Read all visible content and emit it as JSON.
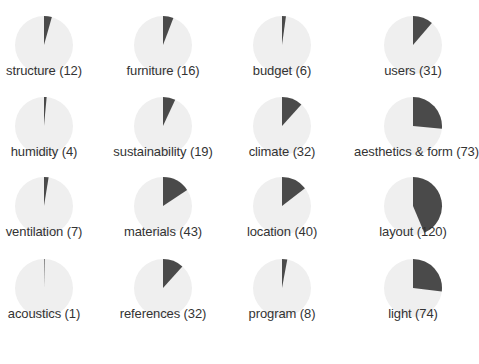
{
  "chart_data": {
    "type": "pie",
    "layout": "small-multiples 4x4",
    "total": 275,
    "colors": {
      "slice": "#4a4a4a",
      "rest": "#efefef"
    },
    "panels": [
      {
        "name": "structure",
        "value": 12,
        "label": "structure (12)"
      },
      {
        "name": "furniture",
        "value": 16,
        "label": "furniture (16)"
      },
      {
        "name": "budget",
        "value": 6,
        "label": "budget (6)"
      },
      {
        "name": "users",
        "value": 31,
        "label": "users (31)"
      },
      {
        "name": "humidity",
        "value": 4,
        "label": "humidity (4)"
      },
      {
        "name": "sustainability",
        "value": 19,
        "label": "sustainability (19)"
      },
      {
        "name": "climate",
        "value": 32,
        "label": "climate (32)"
      },
      {
        "name": "aesthetics & form",
        "value": 73,
        "label": "aesthetics & form (73)"
      },
      {
        "name": "ventilation",
        "value": 7,
        "label": "ventilation (7)"
      },
      {
        "name": "materials",
        "value": 43,
        "label": "materials (43)"
      },
      {
        "name": "location",
        "value": 40,
        "label": "location (40)"
      },
      {
        "name": "layout",
        "value": 120,
        "label": "layout (120)"
      },
      {
        "name": "acoustics",
        "value": 1,
        "label": "acoustics (1)"
      },
      {
        "name": "references",
        "value": 32,
        "label": "references (32)"
      },
      {
        "name": "program",
        "value": 8,
        "label": "program (8)"
      },
      {
        "name": "light",
        "value": 74,
        "label": "light (74)"
      }
    ]
  }
}
